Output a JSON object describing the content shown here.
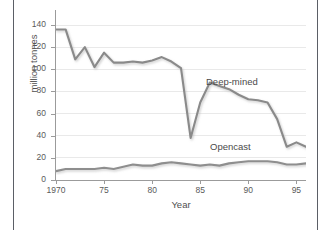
{
  "figure": {
    "background": "#ffffff",
    "edge_rule_color": "#5b5f66",
    "axis_color": "#9b9b9b",
    "grid_color": "#e9e9e9"
  },
  "chart_data": {
    "type": "line",
    "title": "",
    "xlabel": "Year",
    "ylabel": "million tonnes",
    "xlim": [
      1970,
      1996
    ],
    "ylim": [
      0,
      140
    ],
    "grid": "horizontal",
    "legend": "inline-annotations",
    "yticks": [
      0,
      20,
      40,
      60,
      80,
      100,
      120,
      140
    ],
    "ytick_labels": [
      "0",
      "20",
      "40",
      "60",
      "80",
      "100",
      "120",
      "140"
    ],
    "xticks": [
      1970,
      1975,
      1980,
      1985,
      1990,
      1995
    ],
    "xtick_labels": [
      "1970",
      "75",
      "80",
      "85",
      "90",
      "95"
    ],
    "x": [
      1970,
      1971,
      1972,
      1973,
      1974,
      1975,
      1976,
      1977,
      1978,
      1979,
      1980,
      1981,
      1982,
      1983,
      1984,
      1985,
      1986,
      1987,
      1988,
      1989,
      1990,
      1991,
      1992,
      1993,
      1994,
      1995,
      1996
    ],
    "series": [
      {
        "name": "Deep-mined",
        "color": "#8a8a8a",
        "annotation": "Deep-mined",
        "values": [
          136,
          136,
          109,
          120,
          102,
          115,
          106,
          106,
          107,
          106,
          108,
          111,
          107,
          101,
          38,
          70,
          88,
          85,
          82,
          77,
          73,
          72,
          70,
          55,
          30,
          34,
          30
        ]
      },
      {
        "name": "Opencast",
        "color": "#8e8e8e",
        "annotation": "Opencast",
        "values": [
          8,
          10,
          10,
          10,
          10,
          11,
          10,
          12,
          14,
          13,
          13,
          15,
          16,
          15,
          14,
          13,
          14,
          13,
          15,
          16,
          17,
          17,
          17,
          16,
          14,
          14,
          15
        ]
      }
    ]
  }
}
